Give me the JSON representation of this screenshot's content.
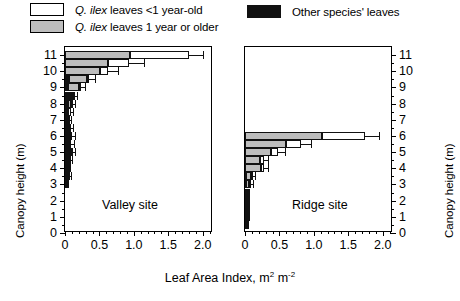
{
  "legend": {
    "items": [
      {
        "id": "white",
        "swatch": "white",
        "prefix": "Q. ilex",
        "text": " leaves <1 year-old",
        "icon": "legend-swatch-white"
      },
      {
        "id": "grey",
        "swatch": "grey",
        "prefix": "Q. ilex",
        "text": " leaves 1 year or older",
        "icon": "legend-swatch-grey"
      },
      {
        "id": "black",
        "swatch": "black",
        "prefix": "",
        "text": "Other species' leaves",
        "icon": "legend-swatch-black"
      }
    ]
  },
  "axes": {
    "ylabel": "Canopy height (m)",
    "xlabel_main": "Leaf Area Index, m",
    "xlabel_sup1": "2",
    "xlabel_mid": " m",
    "xlabel_sup2": "-2",
    "yticks": [
      "0",
      "1",
      "2",
      "3",
      "4",
      "5",
      "6",
      "7",
      "8",
      "9",
      "10",
      "11"
    ],
    "xticks": [
      "0",
      "0.5",
      "1.0",
      "1.5",
      "2.0"
    ],
    "ylim": [
      0,
      11.5
    ],
    "xlim": [
      0,
      2.15
    ]
  },
  "panels": [
    {
      "id": "valley",
      "label": "Valley site"
    },
    {
      "id": "ridge",
      "label": "Ridge site"
    }
  ],
  "colors": {
    "q_ilex_young": "#ffffff",
    "q_ilex_old": "#bdbdbd",
    "other_species": "#111111",
    "axis": "#000000"
  },
  "chart_data": {
    "type": "bar",
    "orientation": "horizontal",
    "stacked": true,
    "title": "",
    "xlabel": "Leaf Area Index, m2 m-2",
    "ylabel": "Canopy height (m)",
    "xlim": [
      0,
      2.15
    ],
    "ylim": [
      0,
      11.5
    ],
    "xticks": [
      0,
      0.5,
      1.0,
      1.5,
      2.0
    ],
    "yticks": [
      0,
      1,
      2,
      3,
      4,
      5,
      6,
      7,
      8,
      9,
      10,
      11
    ],
    "grid": false,
    "legend_position": "top",
    "series_names": [
      "Other species' leaves",
      "Q. ilex leaves 1 year or older",
      "Q. ilex leaves <1 year-old"
    ],
    "panels": [
      {
        "name": "Valley site",
        "heights": [
          11.0,
          10.5,
          10.0,
          9.5,
          9.0,
          8.5,
          8.0,
          7.5,
          7.0,
          6.5,
          6.0,
          5.5,
          5.0,
          4.5,
          4.0,
          3.5,
          3.0
        ],
        "other_species": [
          0.0,
          0.0,
          0.0,
          0.06,
          0.05,
          0.09,
          0.05,
          0.02,
          0.03,
          0.04,
          0.05,
          0.04,
          0.06,
          0.04,
          0.03,
          0.04,
          0.03
        ],
        "q_ilex_old": [
          0.95,
          0.63,
          0.51,
          0.26,
          0.16,
          0.03,
          0.03,
          0.02,
          0.02,
          0.02,
          0.02,
          0.02,
          0.02,
          0.02,
          0.01,
          0.01,
          0.01
        ],
        "q_ilex_young": [
          0.85,
          0.3,
          0.11,
          0.03,
          0.02,
          0.01,
          0.03,
          0.04,
          0.01,
          0.02,
          0.03,
          0.03,
          0.02,
          0.01,
          0.01,
          0.01,
          0.0
        ],
        "total": [
          1.8,
          0.93,
          0.62,
          0.35,
          0.23,
          0.13,
          0.11,
          0.08,
          0.06,
          0.08,
          0.1,
          0.09,
          0.1,
          0.07,
          0.05,
          0.06,
          0.04
        ],
        "error": [
          0.2,
          0.22,
          0.15,
          0.09,
          0.06,
          0.04,
          0.04,
          0.04,
          0.02,
          0.04,
          0.05,
          0.04,
          0.05,
          0.03,
          0.02,
          0.02,
          0.01
        ]
      },
      {
        "name": "Ridge site",
        "heights": [
          6.0,
          5.5,
          5.0,
          4.5,
          4.0,
          3.5,
          3.0,
          2.5,
          2.0,
          1.5,
          1.0,
          0.5
        ],
        "other_species": [
          0.0,
          0.0,
          0.0,
          0.0,
          0.0,
          0.02,
          0.02,
          0.01,
          0.01,
          0.01,
          0.01,
          0.01
        ],
        "q_ilex_old": [
          1.12,
          0.6,
          0.38,
          0.22,
          0.23,
          0.06,
          0.04,
          0.02,
          0.02,
          0.02,
          0.02,
          0.01
        ],
        "q_ilex_young": [
          0.63,
          0.22,
          0.1,
          0.05,
          0.05,
          0.02,
          0.02,
          0.01,
          0.01,
          0.01,
          0.01,
          0.01
        ],
        "total": [
          1.75,
          0.82,
          0.48,
          0.27,
          0.28,
          0.1,
          0.08,
          0.04,
          0.04,
          0.04,
          0.04,
          0.03
        ],
        "error": [
          0.2,
          0.14,
          0.1,
          0.06,
          0.06,
          0.04,
          0.03,
          0.02,
          0.02,
          0.02,
          0.02,
          0.01
        ]
      }
    ]
  }
}
